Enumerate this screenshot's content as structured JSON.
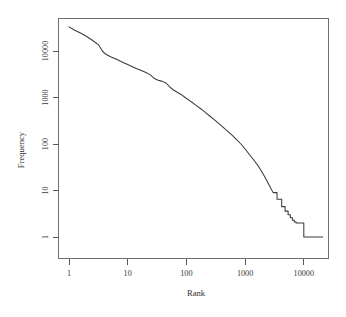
{
  "chart_data": {
    "type": "line",
    "title": "",
    "subtitle": "",
    "xlabel": "Rank",
    "ylabel": "Frequency",
    "xscale": "log",
    "yscale": "log",
    "xlim": [
      1,
      22000
    ],
    "ylim": [
      1,
      45000
    ],
    "grid": false,
    "legend": null,
    "legend_position": "none",
    "xticks": [
      {
        "value": 1,
        "label": "1"
      },
      {
        "value": 10,
        "label": "10"
      },
      {
        "value": 100,
        "label": "100"
      },
      {
        "value": 1000,
        "label": "1000"
      },
      {
        "value": 10000,
        "label": "10000"
      }
    ],
    "yticks": [
      {
        "value": 1,
        "label": "1"
      },
      {
        "value": 10,
        "label": "10"
      },
      {
        "value": 100,
        "label": "100"
      },
      {
        "value": 1000,
        "label": "1000"
      },
      {
        "value": 10000,
        "label": "10000"
      }
    ],
    "series": [
      {
        "name": "rank-frequency",
        "color": "#3b3b3d",
        "x": [
          1,
          1.25,
          1.6,
          2,
          2.5,
          3.2,
          3.7,
          4.2,
          5,
          6,
          7,
          8.5,
          10,
          12,
          14,
          17,
          20,
          24,
          28,
          33,
          38,
          45,
          52,
          60,
          70,
          82,
          95,
          110,
          130,
          150,
          180,
          210,
          250,
          300,
          350,
          420,
          500,
          600,
          700,
          850,
          1000,
          1200,
          1450,
          1750,
          2100,
          2500,
          3000,
          3500,
          4200,
          4800,
          5400,
          5900,
          6400,
          6900,
          7400,
          8200,
          10000,
          13000,
          17000,
          21000
        ],
        "y": [
          33000,
          28000,
          24000,
          20500,
          17000,
          13500,
          10000,
          8600,
          7600,
          6900,
          6300,
          5600,
          5100,
          4600,
          4200,
          3800,
          3500,
          3100,
          2600,
          2350,
          2250,
          2050,
          1700,
          1450,
          1300,
          1150,
          1000,
          880,
          760,
          660,
          560,
          480,
          400,
          330,
          280,
          230,
          190,
          155,
          128,
          100,
          78,
          58,
          43,
          31,
          21,
          14,
          9,
          6.5,
          4.5,
          3.6,
          3.0,
          2.6,
          2.3,
          2.1,
          2.0,
          2.0,
          1,
          1,
          1,
          1
        ]
      }
    ]
  },
  "axes": {
    "x_title": "Rank",
    "y_title": "Frequency"
  }
}
